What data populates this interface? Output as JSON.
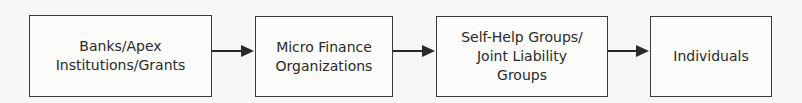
{
  "diagram": {
    "type": "flowchart",
    "direction": "left-to-right",
    "nodes": [
      {
        "id": "n1",
        "label": "Banks/Apex\nInstitutions/Grants"
      },
      {
        "id": "n2",
        "label": "Micro Finance\nOrganizations"
      },
      {
        "id": "n3",
        "label": "Self-Help Groups/\nJoint Liability\nGroups"
      },
      {
        "id": "n4",
        "label": "Individuals"
      }
    ],
    "edges": [
      {
        "from": "n1",
        "to": "n2"
      },
      {
        "from": "n2",
        "to": "n3"
      },
      {
        "from": "n3",
        "to": "n4"
      }
    ]
  }
}
